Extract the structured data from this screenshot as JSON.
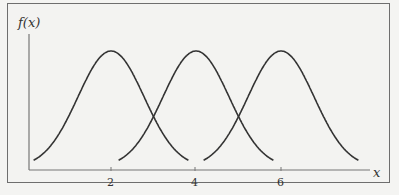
{
  "chart_data": {
    "type": "line",
    "title": "",
    "xlabel": "x",
    "ylabel": "f(x)",
    "x_ticks": [
      "2",
      "4",
      "6"
    ],
    "grid": false,
    "legend": null,
    "series": [
      {
        "name": "normal curve centered at 2",
        "mean": 2,
        "shape": "bell"
      },
      {
        "name": "normal curve centered at 4",
        "mean": 4,
        "shape": "bell"
      },
      {
        "name": "normal curve centered at 6",
        "mean": 6,
        "shape": "bell"
      }
    ],
    "note": "Three identical normal density curves with equal spread, shifted to means 2, 4 and 6"
  },
  "labels": {
    "y_axis": "f(x)",
    "x_axis": "x",
    "tick_2": "2",
    "tick_4": "4",
    "tick_6": "6"
  }
}
